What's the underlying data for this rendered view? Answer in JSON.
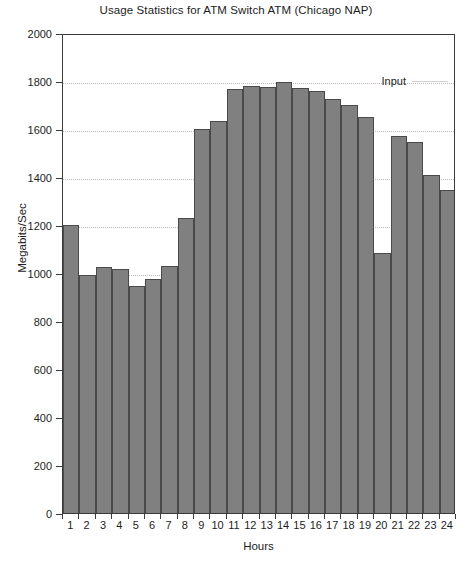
{
  "chart_data": {
    "type": "bar",
    "title": "Usage Statistics for ATM Switch ATM (Chicago NAP)",
    "xlabel": "Hours",
    "ylabel": "Megabits/Sec",
    "ylim": [
      0,
      2000
    ],
    "ytick_step": 200,
    "yticks": [
      0,
      200,
      400,
      600,
      800,
      1000,
      1200,
      1400,
      1600,
      1800,
      2000
    ],
    "grid": true,
    "grid_axis": "y",
    "legend": {
      "position": "top-right-inside",
      "entries": [
        {
          "name": "Input",
          "marker": "line",
          "color": "#cfcfcf"
        }
      ]
    },
    "categories": [
      "1",
      "2",
      "3",
      "4",
      "5",
      "6",
      "7",
      "8",
      "9",
      "10",
      "11",
      "12",
      "13",
      "14",
      "15",
      "16",
      "17",
      "18",
      "19",
      "20",
      "21",
      "22",
      "23",
      "24"
    ],
    "series": [
      {
        "name": "Input",
        "color": "#808080",
        "border_color": "#4a4a4a",
        "values": [
          1200,
          990,
          1025,
          1015,
          945,
          975,
          1030,
          1230,
          1600,
          1635,
          1765,
          1780,
          1775,
          1795,
          1770,
          1760,
          1725,
          1700,
          1650,
          1085,
          1570,
          1545,
          1410,
          1345
        ]
      }
    ]
  },
  "colors": {
    "bar_fill": "#808080",
    "bar_border": "#4a4a4a",
    "frame": "#3a3a3a",
    "gridline": "#b9b9b9",
    "legend_line": "#cfcfcf",
    "text": "#1d1d1d",
    "background": "#ffffff"
  }
}
